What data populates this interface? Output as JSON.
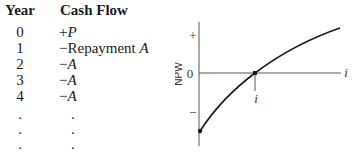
{
  "table": {
    "headers": {
      "year": "Year",
      "cash_flow": "Cash Flow"
    },
    "rows": [
      {
        "year": "0",
        "prefix": "+",
        "text": "",
        "symbol": "P"
      },
      {
        "year": "1",
        "prefix": "−",
        "text": "Repayment ",
        "symbol": "A"
      },
      {
        "year": "2",
        "prefix": "−",
        "text": "",
        "symbol": "A"
      },
      {
        "year": "3",
        "prefix": "−",
        "text": "",
        "symbol": "A"
      },
      {
        "year": "4",
        "prefix": "−",
        "text": "",
        "symbol": "A"
      },
      {
        "year": ".",
        "prefix": ".",
        "text": "",
        "symbol": ""
      },
      {
        "year": ".",
        "prefix": ".",
        "text": "",
        "symbol": ""
      },
      {
        "year": ".",
        "prefix": ".",
        "text": "",
        "symbol": ""
      }
    ]
  },
  "graph": {
    "ylabel": "NPW",
    "xlabel": "i",
    "y_ticks": {
      "plus": "+",
      "zero": "0",
      "minus": "−"
    },
    "crossing_label": "i",
    "line_color": "#1a1a1a",
    "axis_color": "#555555"
  }
}
